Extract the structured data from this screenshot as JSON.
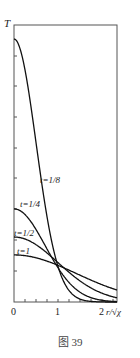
{
  "chart_data": {
    "type": "line",
    "title": "",
    "caption": "图 39",
    "xlabel": "r/√χ",
    "ylabel": "T",
    "xlim": [
      0,
      2.35
    ],
    "x_ticks": [
      "0",
      "1",
      "2"
    ],
    "grid": false,
    "legend": "inline labels",
    "series": [
      {
        "name": "t=1/8",
        "t": 0.125,
        "peak_relative": 1.0,
        "label_pos": [
          1.07,
          0.55
        ]
      },
      {
        "name": "t=1/4",
        "t": 0.25,
        "peak_relative": 0.354,
        "label_pos": [
          0.45,
          0.92
        ]
      },
      {
        "name": "t=1/2",
        "t": 0.5,
        "peak_relative": 0.247,
        "label_pos": [
          0.05,
          1.05
        ]
      },
      {
        "name": "t=1",
        "t": 1.0,
        "peak_relative": 0.179,
        "label_pos": [
          0.35,
          1.0
        ]
      }
    ]
  },
  "labels": {
    "y_axis": "T",
    "x_axis": "r/√χ",
    "x0": "0",
    "x1": "1",
    "x2": "2",
    "t8": "t=1/8",
    "t4": "t=1/4",
    "t2": "t=1/2",
    "t1": "t=1",
    "caption": "图 39"
  }
}
